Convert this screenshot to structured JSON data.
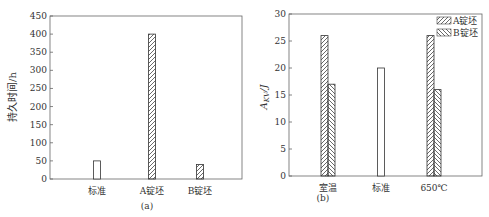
{
  "chart_data": [
    {
      "type": "bar",
      "panel_label": "(a)",
      "title": "",
      "xlabel": "",
      "ylabel": "持久时间/h",
      "ylim": [
        0,
        450
      ],
      "yticks": [
        0,
        50,
        100,
        150,
        200,
        250,
        300,
        350,
        400,
        450
      ],
      "categories": [
        "标准",
        "A锭坯",
        "B锭坯"
      ],
      "values": [
        50,
        400,
        40
      ],
      "patterns": [
        "none",
        "hatch-forward",
        "hatch-forward"
      ],
      "grid": false,
      "legend": null
    },
    {
      "type": "bar",
      "panel_label": "(b)",
      "title": "",
      "xlabel": "",
      "ylabel": "AKV/J",
      "ylim": [
        0,
        30
      ],
      "yticks": [
        0,
        5,
        10,
        15,
        20,
        25,
        30
      ],
      "categories": [
        "室温",
        "标准",
        "650℃"
      ],
      "series": [
        {
          "name": "A锭坯",
          "pattern": "hatch-forward",
          "values": [
            26,
            null,
            26
          ]
        },
        {
          "name": "B锭坯",
          "pattern": "hatch-backward",
          "values": [
            17,
            null,
            16
          ]
        },
        {
          "name": "标准",
          "pattern": "none",
          "values": [
            null,
            20,
            null
          ]
        }
      ],
      "grid": false,
      "legend": {
        "position": "upper right",
        "entries": [
          "A锭坯",
          "B锭坯"
        ]
      }
    }
  ],
  "labels": {
    "a": {
      "ylabel": "持久时间/h",
      "panel": "(a)",
      "cats": [
        "标准",
        "A锭坯",
        "B锭坯"
      ]
    },
    "b": {
      "ylabel_main": "A",
      "ylabel_sub": "KV",
      "ylabel_unit": "/J",
      "panel": "(b)",
      "cats": [
        "室温",
        "标准",
        "650℃"
      ],
      "legend": [
        "A锭坯",
        "B锭坯"
      ]
    }
  }
}
